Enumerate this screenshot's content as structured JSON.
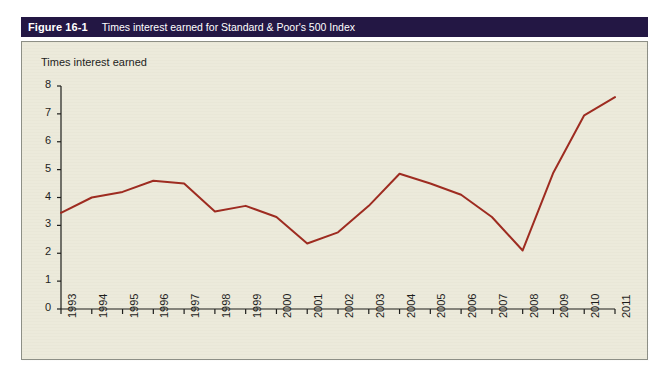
{
  "figure": {
    "number_label": "Figure 16-1",
    "caption": "Times interest earned for Standard & Poor's 500 Index",
    "title_bar_color": "#231744",
    "panel_color": "#eceadb",
    "frame_border_color": "#8d8f86",
    "line_color": "#9e2b20",
    "axis_color": "#1d1d1b"
  },
  "chart_data": {
    "type": "line",
    "title": "Times interest earned for Standard & Poor's 500 Index",
    "subtitle": "",
    "xlabel": "",
    "ylabel": "Times interest earned",
    "categories": [
      "1993",
      "1994",
      "1995",
      "1996",
      "1997",
      "1998",
      "1999",
      "2000",
      "2001",
      "2002",
      "2003",
      "2004",
      "2005",
      "2006",
      "2007",
      "2008",
      "2009",
      "2010",
      "2011"
    ],
    "values": [
      3.45,
      4.0,
      4.2,
      4.6,
      4.5,
      3.5,
      3.7,
      3.3,
      2.35,
      2.75,
      3.7,
      4.85,
      4.5,
      4.1,
      3.3,
      2.1,
      4.9,
      6.95,
      7.6
    ],
    "series": [
      {
        "name": "Times interest earned",
        "color": "#9e2b20",
        "values": [
          3.45,
          4.0,
          4.2,
          4.6,
          4.5,
          3.5,
          3.7,
          3.3,
          2.35,
          2.75,
          3.7,
          4.85,
          4.5,
          4.1,
          3.3,
          2.1,
          4.9,
          6.95,
          7.6
        ]
      }
    ],
    "ylim": [
      0,
      8
    ],
    "yticks": [
      0,
      1,
      2,
      3,
      4,
      5,
      6,
      7,
      8
    ],
    "ytick_labels": [
      "0",
      "1",
      "2",
      "3",
      "4",
      "5",
      "6",
      "7",
      "8"
    ],
    "grid": false,
    "legend": false,
    "legend_position": "none",
    "x_tick_rotation": -90
  }
}
